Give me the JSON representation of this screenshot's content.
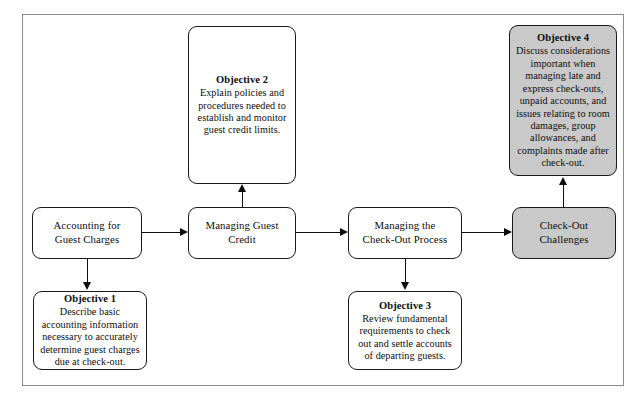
{
  "diagram": {
    "type": "flowchart",
    "orientation": "left-to-right process chain with objective callouts",
    "colors": {
      "background": "#ffffff",
      "border": "#1a1a1a",
      "frame": "#8c8c8c",
      "highlight_fill": "#c9c9c9",
      "text": "#0d0d0d"
    },
    "process_nodes": [
      {
        "id": "accounting",
        "label": "Accounting for\nGuest Charges",
        "line1": "Accounting for",
        "line2": "Guest Charges",
        "filled": false
      },
      {
        "id": "managing-guest-credit",
        "label": "Managing Guest\nCredit",
        "line1": "Managing Guest",
        "line2": "Credit",
        "filled": false
      },
      {
        "id": "managing-check-out-process",
        "label": "Managing the\nCheck-Out Process",
        "line1": "Managing the",
        "line2": "Check-Out Process",
        "filled": false
      },
      {
        "id": "check-out-challenges",
        "label": "Check-Out\nChallenges",
        "line1": "Check-Out",
        "line2": "Challenges",
        "filled": true
      }
    ],
    "objectives": [
      {
        "id": "objective-1",
        "title": "Objective 1",
        "body": "Describe basic accounting information necessary to accurately determine guest charges due at check-out.",
        "position": "below",
        "filled": false,
        "attached_to": "accounting"
      },
      {
        "id": "objective-2",
        "title": "Objective 2",
        "body": "Explain policies and procedures needed to establish and monitor guest credit limits.",
        "position": "above",
        "filled": false,
        "attached_to": "managing-guest-credit"
      },
      {
        "id": "objective-3",
        "title": "Objective 3",
        "body": "Review fundamental requirements to check out and settle accounts of departing guests.",
        "position": "below",
        "filled": false,
        "attached_to": "managing-check-out-process"
      },
      {
        "id": "objective-4",
        "title": "Objective 4",
        "body": "Discuss considerations important when managing late and express check-outs, unpaid accounts, and issues relating to room damages, group allowances, and complaints made after check-out.",
        "position": "above",
        "filled": true,
        "attached_to": "check-out-challenges"
      }
    ],
    "connectors": [
      {
        "id": "arrow-accounting-to-credit",
        "from": "accounting",
        "to": "managing-guest-credit",
        "direction": "right"
      },
      {
        "id": "arrow-credit-to-checkout",
        "from": "managing-guest-credit",
        "to": "managing-check-out-process",
        "direction": "right"
      },
      {
        "id": "arrow-checkout-to-challenges",
        "from": "managing-check-out-process",
        "to": "check-out-challenges",
        "direction": "right"
      },
      {
        "id": "arrow-accounting-to-objective1",
        "from": "accounting",
        "to": "objective-1",
        "direction": "down"
      },
      {
        "id": "arrow-credit-to-objective2",
        "from": "managing-guest-credit",
        "to": "objective-2",
        "direction": "up"
      },
      {
        "id": "arrow-checkout-to-objective3",
        "from": "managing-check-out-process",
        "to": "objective-3",
        "direction": "down"
      },
      {
        "id": "arrow-challenges-to-objective4",
        "from": "check-out-challenges",
        "to": "objective-4",
        "direction": "up"
      }
    ]
  }
}
